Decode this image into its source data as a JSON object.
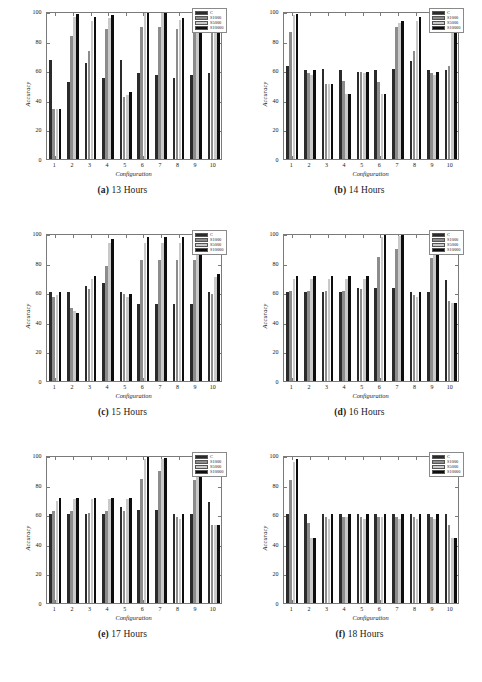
{
  "figure": {
    "xlabel": "Configuration",
    "ylabel": "Accuracy",
    "yticks": [
      0,
      20,
      40,
      60,
      80,
      100
    ],
    "xticks": [
      1,
      2,
      3,
      4,
      5,
      6,
      7,
      8,
      9,
      10
    ],
    "legend": [
      {
        "label": "C",
        "color": "#2b2b2b"
      },
      {
        "label": "S1000",
        "color": "#8c8c8c"
      },
      {
        "label": "S5000",
        "color": "#c9c9c9"
      },
      {
        "label": "S10000",
        "color": "#0d0d0d"
      }
    ]
  },
  "chart_data": [
    {
      "type": "bar",
      "title": "(a) 13 Hours",
      "caption_tag": "(a)",
      "caption_text": "13 Hours",
      "xlabel": "Configuration",
      "ylabel": "Accuracy",
      "ylim": [
        0,
        100
      ],
      "categories": [
        "1",
        "2",
        "3",
        "4",
        "5",
        "6",
        "7",
        "8",
        "9",
        "10"
      ],
      "series": [
        {
          "name": "C",
          "values": [
            67,
            52,
            65,
            55,
            67,
            58,
            57,
            55,
            57,
            58
          ]
        },
        {
          "name": "S1000",
          "values": [
            34,
            83,
            73,
            88,
            42,
            89,
            89,
            88,
            89,
            89
          ]
        },
        {
          "name": "S5000",
          "values": [
            34,
            96,
            93,
            95,
            43,
            99,
            99,
            94,
            99,
            99
          ]
        },
        {
          "name": "S10000",
          "values": [
            34,
            98,
            96,
            97,
            45,
            99,
            99,
            95,
            99,
            99
          ]
        }
      ]
    },
    {
      "type": "bar",
      "title": "(b) 14 Hours",
      "caption_tag": "(b)",
      "caption_text": "14 Hours",
      "xlabel": "Configuration",
      "ylabel": "Accuracy",
      "ylim": [
        0,
        100
      ],
      "categories": [
        "1",
        "2",
        "3",
        "4",
        "5",
        "6",
        "7",
        "8",
        "9",
        "10"
      ],
      "series": [
        {
          "name": "C",
          "values": [
            63,
            60,
            61,
            60,
            59,
            60,
            61,
            66,
            60,
            60
          ]
        },
        {
          "name": "S1000",
          "values": [
            86,
            58,
            51,
            53,
            59,
            52,
            89,
            73,
            58,
            63
          ]
        },
        {
          "name": "S5000",
          "values": [
            97,
            57,
            51,
            44,
            58,
            44,
            92,
            93,
            57,
            85
          ]
        },
        {
          "name": "S10000",
          "values": [
            98,
            60,
            51,
            44,
            59,
            44,
            93,
            96,
            59,
            99
          ]
        }
      ]
    },
    {
      "type": "bar",
      "title": "(c) 15 Hours",
      "caption_tag": "(c)",
      "caption_text": "15 Hours",
      "xlabel": "Configuration",
      "ylabel": "Accuracy",
      "ylim": [
        0,
        100
      ],
      "categories": [
        "1",
        "2",
        "3",
        "4",
        "5",
        "6",
        "7",
        "8",
        "9",
        "10"
      ],
      "series": [
        {
          "name": "C",
          "values": [
            60,
            60,
            64,
            66,
            60,
            52,
            52,
            52,
            52,
            60
          ]
        },
        {
          "name": "S1000",
          "values": [
            57,
            49,
            62,
            78,
            59,
            82,
            82,
            82,
            82,
            59
          ]
        },
        {
          "name": "S5000",
          "values": [
            58,
            47,
            69,
            93,
            57,
            93,
            93,
            93,
            93,
            70
          ]
        },
        {
          "name": "S10000",
          "values": [
            60,
            46,
            71,
            96,
            59,
            97,
            97,
            97,
            97,
            72
          ]
        }
      ]
    },
    {
      "type": "bar",
      "title": "(d) 16 Hours",
      "caption_tag": "(d)",
      "caption_text": "16 Hours",
      "xlabel": "Configuration",
      "ylabel": "Accuracy",
      "ylim": [
        0,
        100
      ],
      "categories": [
        "1",
        "2",
        "3",
        "4",
        "5",
        "6",
        "7",
        "8",
        "9",
        "10"
      ],
      "series": [
        {
          "name": "C",
          "values": [
            60,
            60,
            60,
            60,
            63,
            63,
            63,
            60,
            60,
            68
          ]
        },
        {
          "name": "S1000",
          "values": [
            61,
            61,
            61,
            61,
            62,
            84,
            89,
            58,
            83,
            54
          ]
        },
        {
          "name": "S5000",
          "values": [
            69,
            69,
            69,
            69,
            69,
            97,
            98,
            57,
            96,
            53
          ]
        },
        {
          "name": "S10000",
          "values": [
            71,
            71,
            71,
            71,
            71,
            99,
            99,
            60,
            97,
            53
          ]
        }
      ]
    },
    {
      "type": "bar",
      "title": "(e) 17 Hours",
      "caption_tag": "(e)",
      "caption_text": "17 Hours",
      "xlabel": "Configuration",
      "ylabel": "Accuracy",
      "ylim": [
        0,
        100
      ],
      "categories": [
        "1",
        "2",
        "3",
        "4",
        "5",
        "6",
        "7",
        "8",
        "9",
        "10"
      ],
      "series": [
        {
          "name": "C",
          "values": [
            60,
            60,
            60,
            60,
            65,
            63,
            63,
            60,
            60,
            68
          ]
        },
        {
          "name": "S1000",
          "values": [
            62,
            62,
            61,
            62,
            62,
            84,
            89,
            58,
            83,
            53
          ]
        },
        {
          "name": "S5000",
          "values": [
            69,
            70,
            70,
            70,
            70,
            97,
            97,
            57,
            95,
            53
          ]
        },
        {
          "name": "S10000",
          "values": [
            71,
            71,
            71,
            71,
            71,
            99,
            98,
            60,
            97,
            53
          ]
        }
      ]
    },
    {
      "type": "bar",
      "title": "(f) 18 Hours",
      "caption_tag": "(f)",
      "caption_text": "18 Hours",
      "xlabel": "Configuration",
      "ylabel": "Accuracy",
      "ylim": [
        0,
        100
      ],
      "categories": [
        "1",
        "2",
        "3",
        "4",
        "5",
        "6",
        "7",
        "8",
        "9",
        "10"
      ],
      "series": [
        {
          "name": "C",
          "values": [
            60,
            60,
            60,
            60,
            60,
            60,
            60,
            60,
            60,
            60
          ]
        },
        {
          "name": "S1000",
          "values": [
            83,
            54,
            58,
            58,
            58,
            58,
            58,
            58,
            58,
            53
          ]
        },
        {
          "name": "S5000",
          "values": [
            95,
            44,
            57,
            58,
            57,
            58,
            57,
            57,
            57,
            44
          ]
        },
        {
          "name": "S10000",
          "values": [
            97,
            44,
            60,
            60,
            60,
            60,
            60,
            60,
            60,
            44
          ]
        }
      ]
    }
  ]
}
